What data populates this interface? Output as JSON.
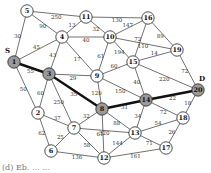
{
  "graph": {
    "source_label": "S",
    "dest_label": "D",
    "colors": {
      "highlight_fill": "#9a9a9a",
      "normal_fill": "#ffffff",
      "edge": "#333333",
      "path_edge": "#111111"
    },
    "nodes": [
      {
        "id": "5",
        "x": 27,
        "y": 11,
        "hl": false
      },
      {
        "id": "11",
        "x": 86,
        "y": 17,
        "hl": false
      },
      {
        "id": "16",
        "x": 148,
        "y": 18,
        "hl": false
      },
      {
        "id": "4",
        "x": 62,
        "y": 37,
        "hl": false
      },
      {
        "id": "10",
        "x": 110,
        "y": 37,
        "hl": false
      },
      {
        "id": "19",
        "x": 177,
        "y": 50,
        "hl": false
      },
      {
        "id": "1",
        "x": 14,
        "y": 62,
        "hl": true
      },
      {
        "id": "3",
        "x": 49,
        "y": 74,
        "hl": true
      },
      {
        "id": "9",
        "x": 97,
        "y": 76,
        "hl": false
      },
      {
        "id": "15",
        "x": 133,
        "y": 62,
        "hl": false
      },
      {
        "id": "20",
        "x": 198,
        "y": 90,
        "hl": true
      },
      {
        "id": "14",
        "x": 146,
        "y": 100,
        "hl": true
      },
      {
        "id": "8",
        "x": 102,
        "y": 109,
        "hl": true
      },
      {
        "id": "2",
        "x": 38,
        "y": 113,
        "hl": false
      },
      {
        "id": "7",
        "x": 74,
        "y": 128,
        "hl": false
      },
      {
        "id": "18",
        "x": 183,
        "y": 118,
        "hl": false
      },
      {
        "id": "13",
        "x": 135,
        "y": 133,
        "hl": false
      },
      {
        "id": "6",
        "x": 51,
        "y": 151,
        "hl": false
      },
      {
        "id": "12",
        "x": 104,
        "y": 158,
        "hl": false
      },
      {
        "id": "17",
        "x": 166,
        "y": 148,
        "hl": false
      }
    ],
    "edges": [
      {
        "a": "5",
        "b": "11",
        "w": "250"
      },
      {
        "a": "5",
        "b": "4",
        "w": "90"
      },
      {
        "a": "5",
        "b": "1",
        "w": "30"
      },
      {
        "a": "11",
        "b": "4",
        "w": "13"
      },
      {
        "a": "11",
        "b": "16",
        "w": "130"
      },
      {
        "a": "11",
        "b": "10",
        "w": "32"
      },
      {
        "a": "4",
        "b": "10",
        "w": "40"
      },
      {
        "a": "4",
        "b": "1",
        "w": "45"
      },
      {
        "a": "4",
        "b": "3",
        "w": "43"
      },
      {
        "a": "4",
        "b": "9",
        "w": "17"
      },
      {
        "a": "16",
        "b": "10",
        "w": "147"
      },
      {
        "a": "16",
        "b": "15",
        "w": "72"
      },
      {
        "a": "16",
        "b": "19",
        "w": "89"
      },
      {
        "a": "10",
        "b": "19",
        "w": "110"
      },
      {
        "a": "10",
        "b": "15",
        "w": "194"
      },
      {
        "a": "10",
        "b": "9",
        "w": "61"
      },
      {
        "a": "19",
        "b": "15",
        "w": "14"
      },
      {
        "a": "19",
        "b": "20",
        "w": "72"
      },
      {
        "a": "15",
        "b": "9",
        "w": "60"
      },
      {
        "a": "15",
        "b": "20",
        "w": "220"
      },
      {
        "a": "15",
        "b": "14",
        "w": "40"
      },
      {
        "a": "1",
        "b": "3",
        "w": "55",
        "bold": true
      },
      {
        "a": "1",
        "b": "2",
        "w": "50"
      },
      {
        "a": "3",
        "b": "9",
        "w": "29"
      },
      {
        "a": "3",
        "b": "8",
        "w": "35",
        "bold": true
      },
      {
        "a": "3",
        "b": "2",
        "w": "60"
      },
      {
        "a": "3",
        "b": "7",
        "w": "250"
      },
      {
        "a": "9",
        "b": "8",
        "w": "120"
      },
      {
        "a": "9",
        "b": "14",
        "w": "150"
      },
      {
        "a": "8",
        "b": "14",
        "w": "31",
        "bold": true
      },
      {
        "a": "14",
        "b": "20",
        "w": "22",
        "bold": true
      },
      {
        "a": "8",
        "b": "7",
        "w": "32"
      },
      {
        "a": "8",
        "b": "13",
        "w": "88"
      },
      {
        "a": "8",
        "b": "12",
        "w": "61"
      },
      {
        "a": "14",
        "b": "13",
        "w": "34"
      },
      {
        "a": "14",
        "b": "18",
        "w": "72"
      },
      {
        "a": "20",
        "b": "18",
        "w": "18"
      },
      {
        "a": "7",
        "b": "2",
        "w": "37"
      },
      {
        "a": "2",
        "b": "6",
        "w": "62"
      },
      {
        "a": "7",
        "b": "6",
        "w": "25"
      },
      {
        "a": "7",
        "b": "13",
        "w": "320"
      },
      {
        "a": "7",
        "b": "12",
        "w": "58"
      },
      {
        "a": "18",
        "b": "13",
        "w": "54"
      },
      {
        "a": "18",
        "b": "17",
        "w": "26"
      },
      {
        "a": "13",
        "b": "17",
        "w": "71"
      },
      {
        "a": "13",
        "b": "12",
        "w": "144"
      },
      {
        "a": "12",
        "b": "17",
        "w": "161"
      },
      {
        "a": "6",
        "b": "12",
        "w": "136"
      }
    ]
  },
  "caption": "(d) Eb. ... ..."
}
